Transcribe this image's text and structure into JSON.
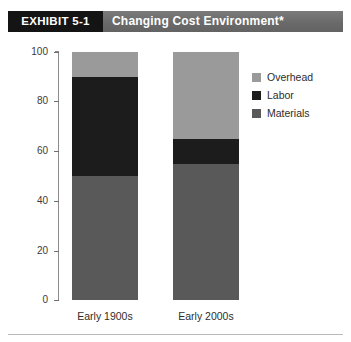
{
  "header": {
    "exhibit_label": "EXHIBIT 5-1",
    "title": "Changing Cost Environment*",
    "exhibit_box_color": "#141414",
    "banner_color": "#6e6e6e",
    "text_color": "#ffffff"
  },
  "legend": {
    "position": "right",
    "items": [
      {
        "label": "Overhead",
        "color": "#9a9a9a"
      },
      {
        "label": "Labor",
        "color": "#1c1c1c"
      },
      {
        "label": "Materials",
        "color": "#595959"
      }
    ]
  },
  "axis": {
    "y_ticks": [
      "0",
      "20",
      "40",
      "60",
      "80",
      "100"
    ],
    "x_labels": [
      "Early 1900s",
      "Early 2000s"
    ]
  },
  "chart_data": {
    "type": "bar",
    "subtype": "stacked-100-percent",
    "title": "Changing Cost Environment*",
    "subtitle": "EXHIBIT 5-1",
    "xlabel": "",
    "ylabel": "",
    "ylim": [
      0,
      100
    ],
    "yticks": [
      0,
      20,
      40,
      60,
      80,
      100
    ],
    "grid": false,
    "legend_position": "right",
    "categories": [
      "Early 1900s",
      "Early 2000s"
    ],
    "series": [
      {
        "name": "Materials",
        "color": "#595959",
        "values": [
          50,
          55
        ]
      },
      {
        "name": "Labor",
        "color": "#1c1c1c",
        "values": [
          40,
          10
        ]
      },
      {
        "name": "Overhead",
        "color": "#9a9a9a",
        "values": [
          10,
          35
        ]
      }
    ],
    "stack_order_bottom_to_top": [
      "Materials",
      "Labor",
      "Overhead"
    ],
    "cumulative_boundaries": {
      "Early 1900s": [
        0,
        50,
        90,
        100
      ],
      "Early 2000s": [
        0,
        55,
        65,
        100
      ]
    },
    "annotations": [
      "*"
    ]
  }
}
